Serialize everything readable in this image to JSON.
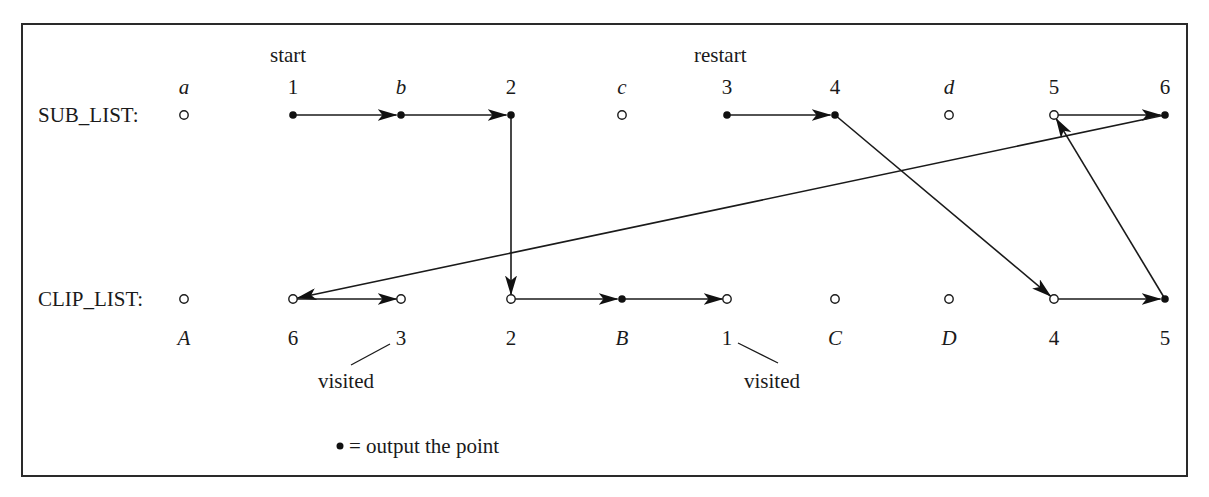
{
  "diagram": {
    "rows": {
      "sub_list": {
        "label": "SUB_LIST:",
        "y": 115
      },
      "clip_list": {
        "label": "CLIP_LIST:",
        "y": 299
      }
    },
    "annotations": {
      "start": "start",
      "restart": "restart",
      "visited_1": "visited",
      "visited_2": "visited",
      "legend_symbol": "•",
      "legend_text": "= output the point"
    },
    "sub_list_nodes": [
      {
        "id": "a",
        "label": "a",
        "italic": true,
        "x": 184,
        "filled": false
      },
      {
        "id": "s1",
        "label": "1",
        "italic": false,
        "x": 293,
        "filled": true
      },
      {
        "id": "b",
        "label": "b",
        "italic": true,
        "x": 401,
        "filled": true
      },
      {
        "id": "s2",
        "label": "2",
        "italic": false,
        "x": 511,
        "filled": true
      },
      {
        "id": "c",
        "label": "c",
        "italic": true,
        "x": 622,
        "filled": false
      },
      {
        "id": "s3",
        "label": "3",
        "italic": false,
        "x": 727,
        "filled": true
      },
      {
        "id": "s4",
        "label": "4",
        "italic": false,
        "x": 835,
        "filled": true
      },
      {
        "id": "d",
        "label": "d",
        "italic": true,
        "x": 949,
        "filled": false
      },
      {
        "id": "s5",
        "label": "5",
        "italic": false,
        "x": 1054,
        "filled": false
      },
      {
        "id": "s6",
        "label": "6",
        "italic": false,
        "x": 1165,
        "filled": true
      }
    ],
    "clip_list_nodes": [
      {
        "id": "A",
        "label": "A",
        "italic": true,
        "x": 184,
        "filled": false
      },
      {
        "id": "c6",
        "label": "6",
        "italic": false,
        "x": 293,
        "filled": false
      },
      {
        "id": "c3",
        "label": "3",
        "italic": false,
        "x": 401,
        "filled": false
      },
      {
        "id": "c2",
        "label": "2",
        "italic": false,
        "x": 511,
        "filled": false
      },
      {
        "id": "B",
        "label": "B",
        "italic": true,
        "x": 622,
        "filled": true
      },
      {
        "id": "c1",
        "label": "1",
        "italic": false,
        "x": 727,
        "filled": false
      },
      {
        "id": "C",
        "label": "C",
        "italic": true,
        "x": 835,
        "filled": false
      },
      {
        "id": "D",
        "label": "D",
        "italic": true,
        "x": 949,
        "filled": false
      },
      {
        "id": "c4",
        "label": "4",
        "italic": false,
        "x": 1054,
        "filled": false
      },
      {
        "id": "c5",
        "label": "5",
        "italic": false,
        "x": 1165,
        "filled": true
      }
    ],
    "edges": [
      {
        "from": "s1",
        "to": "b"
      },
      {
        "from": "b",
        "to": "s2"
      },
      {
        "from": "s2",
        "to": "c2"
      },
      {
        "from": "c2",
        "to": "B"
      },
      {
        "from": "B",
        "to": "c1"
      },
      {
        "from": "s3",
        "to": "s4"
      },
      {
        "from": "s4",
        "to": "c4"
      },
      {
        "from": "c4",
        "to": "c5"
      },
      {
        "from": "c5",
        "to": "s5"
      },
      {
        "from": "s5",
        "to": "s6"
      },
      {
        "from": "s6",
        "to": "c6"
      },
      {
        "from": "c6",
        "to": "c3"
      }
    ]
  }
}
